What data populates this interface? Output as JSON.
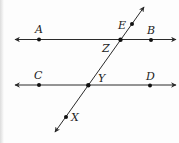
{
  "diagram": {
    "type": "parallel-lines-with-transversal",
    "colors": {
      "line": "#2a2a2a",
      "point": "#111111",
      "label": "#222222",
      "background": "#fdfdfd"
    },
    "lines": [
      {
        "id": "line-AB",
        "name": "top-parallel-line",
        "x1": 15,
        "y1": 39.5,
        "x2": 176,
        "y2": 39.5,
        "arrows": "both"
      },
      {
        "id": "line-CD",
        "name": "bottom-parallel-line",
        "x1": 15,
        "y1": 85,
        "x2": 176,
        "y2": 85,
        "arrows": "both"
      },
      {
        "id": "line-EX",
        "name": "transversal",
        "x1": 55,
        "y1": 132,
        "x2": 144,
        "y2": 7,
        "arrows": "both"
      }
    ],
    "points": [
      {
        "id": "A",
        "label": "A",
        "x": 39,
        "y": 39.5,
        "lx": 35,
        "ly": 33
      },
      {
        "id": "B",
        "label": "B",
        "x": 151,
        "y": 40,
        "lx": 147,
        "ly": 34
      },
      {
        "id": "Z",
        "label": "Z",
        "x": 120.5,
        "y": 39.7,
        "lx": 102,
        "ly": 52
      },
      {
        "id": "E",
        "label": "E",
        "x": 132,
        "y": 24,
        "lx": 118,
        "ly": 29
      },
      {
        "id": "C",
        "label": "C",
        "x": 39,
        "y": 85,
        "lx": 34,
        "ly": 79
      },
      {
        "id": "Y",
        "label": "Y",
        "x": 88.3,
        "y": 85.3,
        "lx": 98,
        "ly": 82
      },
      {
        "id": "D",
        "label": "D",
        "x": 150,
        "y": 85.5,
        "lx": 146,
        "ly": 80
      },
      {
        "id": "X",
        "label": "X",
        "x": 66,
        "y": 117,
        "lx": 71,
        "ly": 121
      }
    ],
    "labels": {
      "A": "A",
      "B": "B",
      "C": "C",
      "D": "D",
      "E": "E",
      "X": "X",
      "Y": "Y",
      "Z": "Z"
    }
  }
}
